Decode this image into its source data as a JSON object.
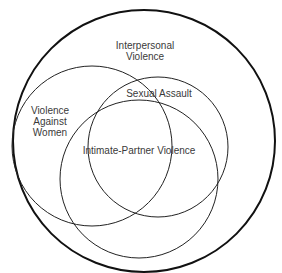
{
  "diagram": {
    "type": "venn",
    "sets": [
      {
        "id": "interpersonal",
        "label_line1": "Interpersonal",
        "label_line2": "Violence"
      },
      {
        "id": "vaw",
        "label_line1": "Violence",
        "label_line2": "Against",
        "label_line3": "Women"
      },
      {
        "id": "sexual-assault",
        "label": "Sexual Assault"
      },
      {
        "id": "ipv",
        "label": "Intimate-Partner Violence"
      }
    ],
    "colors": {
      "stroke": "#1a1a1a",
      "background": "#ffffff",
      "text": "#3a3a3a"
    }
  }
}
